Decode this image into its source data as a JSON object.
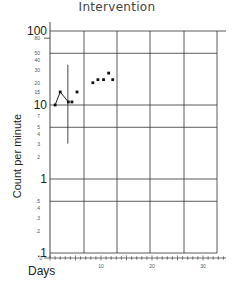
{
  "chart_data": {
    "type": "scatter",
    "title": "Intervention",
    "xlabel": "Days",
    "ylabel": "Count per minute",
    "yscale": "log",
    "ylim": [
      0.1,
      100
    ],
    "xlim": [
      0,
      35
    ],
    "y_tick_labels_major": [
      "100",
      "10",
      "1",
      ".1"
    ],
    "y_tick_labels_minor": [
      "80",
      "50",
      "40",
      "30",
      "20",
      "15",
      "7",
      "5",
      "4",
      "3",
      "2",
      ".5",
      ".4",
      ".3",
      ".2"
    ],
    "x_tick_labels": [
      "0",
      "10",
      "20",
      "30"
    ],
    "grid": true,
    "series": [
      {
        "name": "connected",
        "style": "line+markers",
        "points": [
          [
            1,
            10
          ],
          [
            2,
            15
          ],
          [
            3.6,
            11
          ]
        ]
      },
      {
        "name": "points",
        "style": "markers",
        "points": [
          [
            4.3,
            11
          ],
          [
            5.3,
            15
          ],
          [
            8.4,
            20
          ],
          [
            9.4,
            22
          ],
          [
            10.5,
            22
          ],
          [
            11.5,
            27
          ],
          [
            12.3,
            22
          ]
        ]
      }
    ],
    "annotations": [
      {
        "type": "vertical-line",
        "x": 3.5,
        "y_from": 3,
        "y_to": 35,
        "label": "phase change"
      }
    ]
  }
}
